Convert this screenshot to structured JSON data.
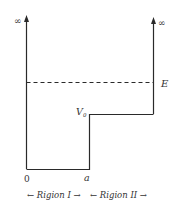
{
  "diagram": {
    "type": "potential-step-well",
    "labels": {
      "infinity_left": "∞",
      "infinity_right": "∞",
      "energy": "E",
      "potential_main": "V",
      "potential_sub": "0",
      "origin": "0",
      "position_a": "a",
      "region_1": "← Rigion I →",
      "region_2": "← Rigion II →"
    },
    "colors": {
      "line": "#2a2a2a",
      "text": "#333333",
      "background": "#ffffff"
    }
  }
}
